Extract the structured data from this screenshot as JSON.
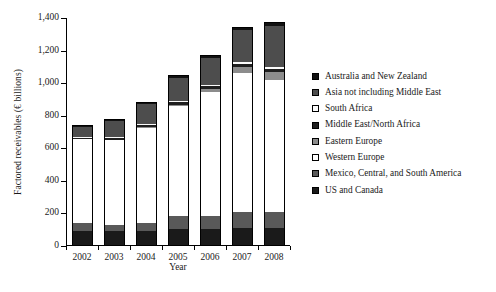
{
  "chart_data": {
    "type": "bar",
    "stacked": true,
    "title": "",
    "xlabel": "Year",
    "ylabel": "Factored receivables (€ billions)",
    "categories": [
      "2002",
      "2003",
      "2004",
      "2005",
      "2006",
      "2007",
      "2008"
    ],
    "ylim": [
      0,
      1400
    ],
    "yticks": [
      0,
      200,
      400,
      600,
      800,
      1000,
      1200,
      1400
    ],
    "ytick_labels": [
      "0",
      "200",
      "400",
      "600",
      "800",
      "1,000",
      "1,200",
      "1,400"
    ],
    "grid": false,
    "legend_position": "right",
    "series": [
      {
        "name": "US and Canada",
        "color": "#1a1a1a",
        "values": [
          95,
          90,
          92,
          105,
          107,
          112,
          113
        ]
      },
      {
        "name": "Mexico, Central, and South America",
        "color": "#595959",
        "values": [
          44,
          37,
          50,
          77,
          80,
          95,
          99
        ]
      },
      {
        "name": "Western Europe",
        "color": "#ffffff",
        "values": [
          516,
          527,
          582,
          675,
          758,
          858,
          806
        ]
      },
      {
        "name": "Eastern Europe",
        "color": "#8c8c8c",
        "values": [
          0,
          0,
          8,
          12,
          20,
          35,
          48
        ]
      },
      {
        "name": "Middle East/North Africa",
        "color": "#1f1f1f",
        "values": [
          10,
          9,
          11,
          14,
          17,
          20,
          24
        ]
      },
      {
        "name": "South Africa",
        "color": "#fbfbfb",
        "values": [
          5,
          5,
          6,
          7,
          8,
          10,
          11
        ]
      },
      {
        "name": "Asia not including Middle East",
        "color": "#4d4d4d",
        "values": [
          63,
          98,
          122,
          143,
          163,
          196,
          249
        ]
      },
      {
        "name": "Australia and New Zealand",
        "color": "#111111",
        "values": [
          12,
          16,
          12,
          19,
          22,
          22,
          25
        ]
      }
    ],
    "totals": [
      745,
      782,
      883,
      1052,
      1175,
      1348,
      1375
    ]
  },
  "legend": {
    "entries": [
      {
        "label": "Australia and New Zealand",
        "swatch": "#111111"
      },
      {
        "label": "Asia not including Middle East",
        "swatch": "#4d4d4d"
      },
      {
        "label": "South Africa",
        "swatch": "#fbfbfb"
      },
      {
        "label": "Middle East/North Africa",
        "swatch": "#1f1f1f"
      },
      {
        "label": "Eastern Europe",
        "swatch": "#8c8c8c"
      },
      {
        "label": "Western Europe",
        "swatch": "#ffffff"
      },
      {
        "label": "Mexico, Central, and South America",
        "swatch": "#595959"
      },
      {
        "label": "US and Canada",
        "swatch": "#1a1a1a"
      }
    ]
  }
}
